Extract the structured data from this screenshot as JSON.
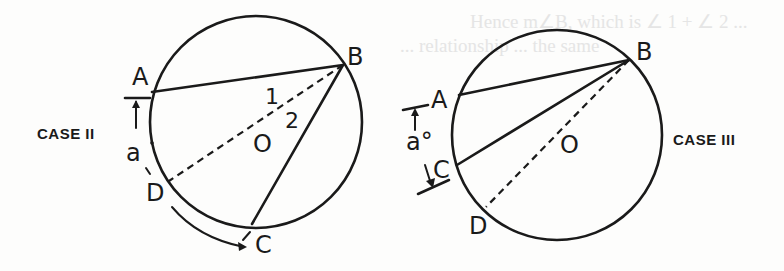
{
  "figure": {
    "bleed_through_text": [
      "Hence m∠B, which is ∠ 1 + ∠ 2 ...",
      "... relationship ... the same"
    ],
    "case_ii": {
      "title": "CASE II",
      "points": {
        "A": "A",
        "B": "B",
        "C": "C",
        "D": "D",
        "O": "O"
      },
      "angle_labels": {
        "one": "1",
        "two": "2"
      },
      "arc_label": "a",
      "segments": [
        {
          "from": "A",
          "to": "B",
          "style": "solid"
        },
        {
          "from": "B",
          "to": "C",
          "style": "solid"
        },
        {
          "from": "B",
          "to": "D",
          "style": "dashed",
          "through": "O"
        }
      ]
    },
    "case_iii": {
      "title": "CASE III",
      "points": {
        "A": "A",
        "B": "B",
        "C": "C",
        "D": "D",
        "O": "O"
      },
      "arc_label": "a°",
      "segments": [
        {
          "from": "A",
          "to": "B",
          "style": "solid"
        },
        {
          "from": "C",
          "to": "B",
          "style": "solid"
        },
        {
          "from": "B",
          "to": "D",
          "style": "dashed",
          "through": "O"
        }
      ]
    }
  },
  "colors": {
    "ink": "#1a1a1a",
    "paper": "#fdfdfc",
    "ghost": "#e3e3e3"
  }
}
